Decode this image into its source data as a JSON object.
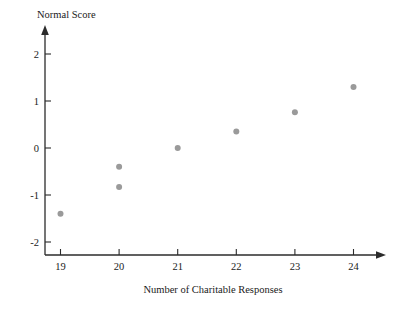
{
  "chart_data": {
    "type": "scatter",
    "title": "",
    "xlabel": "Number of Charitable Responses",
    "ylabel": "Normal Score",
    "xlim": [
      18.5,
      24.6
    ],
    "ylim": [
      -2.35,
      2.45
    ],
    "xticks": [
      19,
      20,
      21,
      22,
      23,
      24
    ],
    "yticks": [
      2,
      1,
      0,
      -1,
      -2
    ],
    "xtick_labels": [
      "19",
      "20",
      "21",
      "22",
      "23",
      "24"
    ],
    "ytick_labels": [
      "2",
      "1",
      "0",
      "-1",
      "-2"
    ],
    "grid": false,
    "legend": false,
    "point_color": "#9a9a9a",
    "point_radius": 3,
    "axis_color": "#2b2b2b",
    "x": [
      19,
      20,
      20,
      21,
      22,
      23,
      24
    ],
    "y": [
      -1.4,
      -0.4,
      -0.83,
      0.0,
      0.35,
      0.76,
      1.3
    ],
    "points": [
      {
        "x": 19,
        "y": -1.4
      },
      {
        "x": 20,
        "y": -0.4
      },
      {
        "x": 20,
        "y": -0.83
      },
      {
        "x": 21,
        "y": 0.0
      },
      {
        "x": 22,
        "y": 0.35
      },
      {
        "x": 23,
        "y": 0.76
      },
      {
        "x": 24,
        "y": 1.3
      }
    ]
  },
  "labels": {
    "y_axis_title": "Normal Score",
    "x_axis_title": "Number of Charitable Responses"
  }
}
